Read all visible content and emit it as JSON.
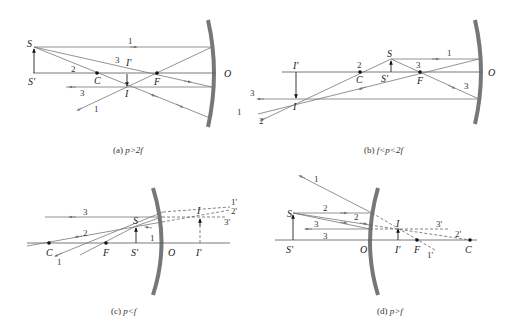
{
  "panels": [
    {
      "id": "a",
      "caption": "(a) p>2f",
      "caption_prefix": "(a) ",
      "caption_math": "p>2f",
      "labels": {
        "S": "S",
        "S_prime": "S'",
        "C": "C",
        "F": "F",
        "O": "O",
        "I": "I",
        "I_prime": "I'"
      },
      "ray_numbers": [
        "1",
        "2",
        "3",
        "3",
        "1"
      ]
    },
    {
      "id": "b",
      "caption": "(b) f<p<2f",
      "caption_prefix": "(b) ",
      "caption_math": "f<p<2f",
      "labels": {
        "S": "S",
        "S_prime": "S'",
        "C": "C",
        "F": "F",
        "O": "O",
        "I": "I",
        "I_prime": "I'"
      },
      "ray_numbers": [
        "1",
        "2",
        "3",
        "3",
        "3",
        "1",
        "2"
      ]
    },
    {
      "id": "c",
      "caption": "(c) p<f",
      "caption_prefix": "(c) ",
      "caption_math": "p<f",
      "labels": {
        "S": "S",
        "S_prime": "S'",
        "C": "C",
        "F": "F",
        "O": "O",
        "I": "I",
        "I_prime": "I'"
      },
      "ray_numbers": [
        "3",
        "2",
        "1",
        "1"
      ],
      "virtual_ray_numbers": [
        "1'",
        "2'",
        "3'"
      ]
    },
    {
      "id": "d",
      "caption": "(d) p>f",
      "caption_prefix": "(d) ",
      "caption_math": "p>f",
      "labels": {
        "S": "S",
        "S_prime": "S'",
        "C": "C",
        "F": "F",
        "O": "O",
        "I": "I",
        "I_prime": "I'"
      },
      "ray_numbers": [
        "1",
        "2",
        "2",
        "3",
        "3"
      ],
      "virtual_ray_numbers": [
        "3'",
        "2'",
        "1'"
      ]
    }
  ]
}
